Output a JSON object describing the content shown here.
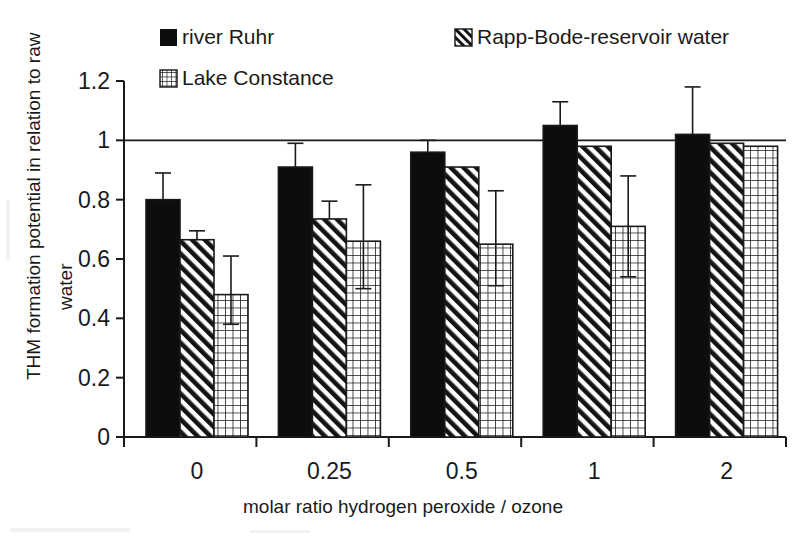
{
  "chart_data": {
    "type": "bar",
    "title": "",
    "xlabel": "molar ratio hydrogen peroxide / ozone",
    "ylabel": "THM formation potential in relation to raw water",
    "categories": [
      "0",
      "0.25",
      "0.5",
      "1",
      "2"
    ],
    "ylim": [
      0,
      1.2
    ],
    "ytick_labels": [
      "0",
      "0.2",
      "0.4",
      "0.6",
      "0.8",
      "1",
      "1.2"
    ],
    "ytick_values": [
      0,
      0.2,
      0.4,
      0.6,
      0.8,
      1,
      1.2
    ],
    "grid": false,
    "legend_position": "top",
    "reference_line": 1.0,
    "series": [
      {
        "name": "river Ruhr",
        "pattern": "solid-black",
        "values": [
          0.8,
          0.91,
          0.96,
          1.05,
          1.02
        ],
        "err_upper": [
          0.89,
          0.99,
          1.0,
          1.13,
          1.18
        ],
        "err_lower": [
          0.8,
          0.91,
          0.96,
          1.05,
          1.02
        ]
      },
      {
        "name": "Rapp-Bode-reservoir water",
        "pattern": "diagonal-hatch",
        "values": [
          0.665,
          0.735,
          0.91,
          0.98,
          0.99
        ],
        "err_upper": [
          0.695,
          0.795,
          0.91,
          0.98,
          0.99
        ],
        "err_lower": [
          0.665,
          0.735,
          0.91,
          0.98,
          0.99
        ]
      },
      {
        "name": "Lake Constance",
        "pattern": "cross-grid",
        "values": [
          0.48,
          0.66,
          0.65,
          0.71,
          0.98
        ],
        "err_upper": [
          0.61,
          0.85,
          0.83,
          0.88,
          0.98
        ],
        "err_lower": [
          0.38,
          0.5,
          0.51,
          0.54,
          0.98
        ]
      }
    ]
  },
  "legend": {
    "entries": [
      {
        "label": "river Ruhr",
        "swatch": "solid-black-swatch"
      },
      {
        "label": "Rapp-Bode-reservoir water",
        "swatch": "diagonal-hatch-swatch"
      },
      {
        "label": "Lake Constance",
        "swatch": "cross-grid-swatch"
      }
    ]
  },
  "colors": {
    "ink": "#1a1a1a",
    "background": "#ffffff",
    "bar_fill": "#000000"
  }
}
